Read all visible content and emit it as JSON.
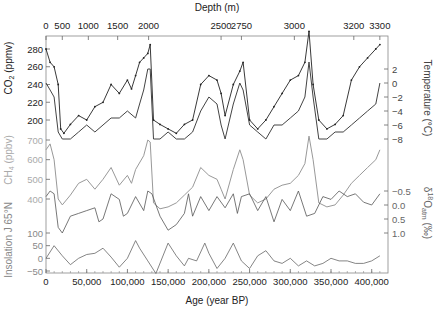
{
  "chart_data": {
    "type": "line",
    "title": "",
    "top_axis": {
      "label": "Depth (m)",
      "ticks": [
        "0",
        "500",
        "1000",
        "1500",
        "2000",
        "2500",
        "2750",
        "3000",
        "3200",
        "3300"
      ],
      "tick_age_positions": [
        0,
        20000,
        52000,
        88000,
        126000,
        215000,
        240000,
        305000,
        378000,
        410000
      ]
    },
    "bottom_axis": {
      "label": "Age (year BP)",
      "ticks": [
        "0",
        "50,000",
        "100,000",
        "150,000",
        "200,000",
        "250,000",
        "300,000",
        "350,000",
        "400,000"
      ],
      "tick_values": [
        0,
        50000,
        100000,
        150000,
        200000,
        250000,
        300000,
        350000,
        400000
      ],
      "range": [
        0,
        420000
      ]
    },
    "left_axes": [
      {
        "id": "co2",
        "label": "CO2 (ppmv)",
        "ticks": [
          "280",
          "260",
          "240",
          "220",
          "200"
        ],
        "tick_values": [
          280,
          260,
          240,
          220,
          200
        ],
        "color": "#222222"
      },
      {
        "id": "ch4",
        "label": "CH4 (ppbv)",
        "ticks": [
          "700",
          "600",
          "500",
          "400"
        ],
        "tick_values": [
          700,
          600,
          500,
          400
        ],
        "color": "#999999"
      },
      {
        "id": "insolation",
        "label": "Insolation J 65°N",
        "ticks": [
          "100",
          "50",
          "0",
          "−50"
        ],
        "tick_values": [
          100,
          50,
          0,
          -50
        ],
        "color": "#666666"
      }
    ],
    "right_axes": [
      {
        "id": "temperature",
        "label": "Temperature (°C)",
        "ticks": [
          "2",
          "0",
          "−2",
          "−4",
          "−6",
          "−8"
        ],
        "tick_values": [
          2,
          0,
          -2,
          -4,
          -6,
          -8
        ],
        "color": "#444444"
      },
      {
        "id": "d18o",
        "label": "δ18Oatm (‰)",
        "ticks": [
          "−0.5",
          "0.0",
          "0.5",
          "1.0"
        ],
        "tick_values": [
          -0.5,
          0.0,
          0.5,
          1.0
        ],
        "color": "#555555"
      }
    ],
    "series": [
      {
        "name": "CO2",
        "unit": "ppmv",
        "color": "#222222",
        "x": [
          0,
          5000,
          10000,
          15000,
          18000,
          22000,
          30000,
          40000,
          50000,
          60000,
          70000,
          80000,
          90000,
          100000,
          105000,
          110000,
          115000,
          120000,
          125000,
          128000,
          132000,
          140000,
          150000,
          160000,
          170000,
          180000,
          190000,
          200000,
          210000,
          215000,
          220000,
          230000,
          238000,
          242000,
          250000,
          260000,
          270000,
          280000,
          290000,
          300000,
          310000,
          318000,
          323000,
          328000,
          335000,
          345000,
          355000,
          365000,
          375000,
          385000,
          395000,
          405000,
          410000
        ],
        "y": [
          280,
          265,
          260,
          240,
          190,
          185,
          195,
          205,
          200,
          215,
          220,
          240,
          230,
          245,
          235,
          250,
          265,
          270,
          275,
          285,
          200,
          195,
          190,
          185,
          195,
          200,
          240,
          250,
          245,
          230,
          205,
          240,
          255,
          265,
          200,
          190,
          200,
          215,
          230,
          245,
          250,
          265,
          300,
          240,
          200,
          190,
          195,
          205,
          245,
          260,
          270,
          280,
          285
        ]
      },
      {
        "name": "Temperature",
        "unit": "°C",
        "color": "#444444",
        "x": [
          0,
          5000,
          10000,
          15000,
          20000,
          30000,
          40000,
          50000,
          60000,
          70000,
          80000,
          90000,
          100000,
          110000,
          115000,
          120000,
          125000,
          128000,
          132000,
          140000,
          150000,
          160000,
          170000,
          180000,
          190000,
          200000,
          210000,
          215000,
          220000,
          230000,
          238000,
          242000,
          250000,
          260000,
          270000,
          280000,
          290000,
          300000,
          310000,
          318000,
          323000,
          328000,
          335000,
          345000,
          355000,
          365000,
          375000,
          385000,
          395000,
          405000,
          410000
        ],
        "y": [
          0,
          -1,
          -2,
          -7,
          -8,
          -8,
          -7,
          -6,
          -7,
          -6,
          -5,
          -5,
          -4,
          -5,
          -3,
          -1,
          2,
          2,
          -8,
          -8,
          -7,
          -8,
          -8,
          -7,
          -4,
          -2,
          -3,
          -6,
          -8,
          -3,
          0,
          -1,
          -6,
          -7,
          -8,
          -6,
          -6,
          -5,
          -4,
          -2,
          3,
          -2,
          -8,
          -8,
          -7,
          -7,
          -6,
          -5,
          -4,
          -3,
          0
        ]
      },
      {
        "name": "CH4",
        "unit": "ppbv",
        "color": "#999999",
        "x": [
          0,
          5000,
          10000,
          15000,
          20000,
          30000,
          40000,
          50000,
          60000,
          70000,
          80000,
          90000,
          100000,
          105000,
          110000,
          120000,
          125000,
          128000,
          132000,
          140000,
          150000,
          160000,
          170000,
          180000,
          190000,
          200000,
          210000,
          215000,
          220000,
          230000,
          238000,
          242000,
          250000,
          260000,
          270000,
          280000,
          290000,
          300000,
          310000,
          318000,
          323000,
          328000,
          335000,
          345000,
          355000,
          365000,
          375000,
          385000,
          395000,
          405000,
          410000
        ],
        "y": [
          650,
          680,
          600,
          400,
          370,
          420,
          480,
          500,
          450,
          500,
          560,
          470,
          520,
          480,
          550,
          620,
          700,
          690,
          380,
          350,
          360,
          380,
          420,
          460,
          560,
          520,
          500,
          450,
          400,
          550,
          650,
          600,
          420,
          380,
          400,
          450,
          470,
          480,
          520,
          580,
          720,
          600,
          380,
          360,
          370,
          420,
          480,
          520,
          560,
          600,
          650
        ]
      },
      {
        "name": "d18Oatm",
        "unit": "‰",
        "color": "#555555",
        "x": [
          0,
          5000,
          10000,
          15000,
          20000,
          30000,
          40000,
          50000,
          60000,
          65000,
          70000,
          80000,
          90000,
          95000,
          100000,
          110000,
          120000,
          125000,
          130000,
          140000,
          150000,
          160000,
          170000,
          175000,
          180000,
          190000,
          200000,
          210000,
          220000,
          230000,
          235000,
          240000,
          250000,
          260000,
          270000,
          280000,
          290000,
          300000,
          310000,
          320000,
          330000,
          340000,
          350000,
          360000,
          370000,
          380000,
          390000,
          400000,
          410000
        ],
        "y": [
          -0.3,
          -0.5,
          -0.4,
          0.8,
          1.0,
          0.4,
          0.3,
          0.2,
          0.1,
          0.6,
          0.5,
          -0.4,
          -0.2,
          0.4,
          0.3,
          -0.3,
          0.2,
          -0.5,
          -0.4,
          0.4,
          0.9,
          0.7,
          0.3,
          -0.4,
          0.4,
          -0.3,
          0.2,
          -0.3,
          0.1,
          -0.4,
          0.3,
          -0.3,
          -0.4,
          0.2,
          -0.3,
          0.6,
          -0.2,
          0.2,
          -0.5,
          0.4,
          0.3,
          -0.3,
          -0.2,
          -0.5,
          -0.3,
          -0.4,
          -0.1,
          0.0,
          -0.4
        ]
      },
      {
        "name": "Insolation J 65°N",
        "unit": "",
        "color": "#666666",
        "x": [
          0,
          10000,
          20000,
          30000,
          40000,
          50000,
          60000,
          70000,
          80000,
          90000,
          100000,
          110000,
          115000,
          125000,
          135000,
          150000,
          160000,
          170000,
          175000,
          185000,
          195000,
          200000,
          210000,
          220000,
          230000,
          240000,
          250000,
          260000,
          270000,
          280000,
          290000,
          300000,
          310000,
          320000,
          330000,
          340000,
          350000,
          360000,
          370000,
          380000,
          390000,
          400000,
          410000
        ],
        "y": [
          0,
          50,
          10,
          -25,
          0,
          15,
          20,
          40,
          5,
          -35,
          0,
          70,
          40,
          -10,
          -60,
          60,
          10,
          -30,
          0,
          -10,
          60,
          20,
          -40,
          0,
          60,
          -10,
          -40,
          10,
          30,
          -10,
          -20,
          0,
          -30,
          -10,
          -30,
          -20,
          0,
          -10,
          -10,
          -20,
          -20,
          -10,
          10
        ]
      }
    ],
    "legend": {
      "visible": false
    },
    "grid": false
  },
  "labels": {
    "top_axis_title": "Depth (m)",
    "bottom_axis_title": "Age (year BP)",
    "co2_axis": "CO2 (ppmv)",
    "ch4_axis": "CH4 (ppbv)",
    "insolation_axis": "Insolation J 65°N",
    "temperature_axis": "Temperature (°C)",
    "d18o_axis": "δ18Oatm (‰)"
  }
}
